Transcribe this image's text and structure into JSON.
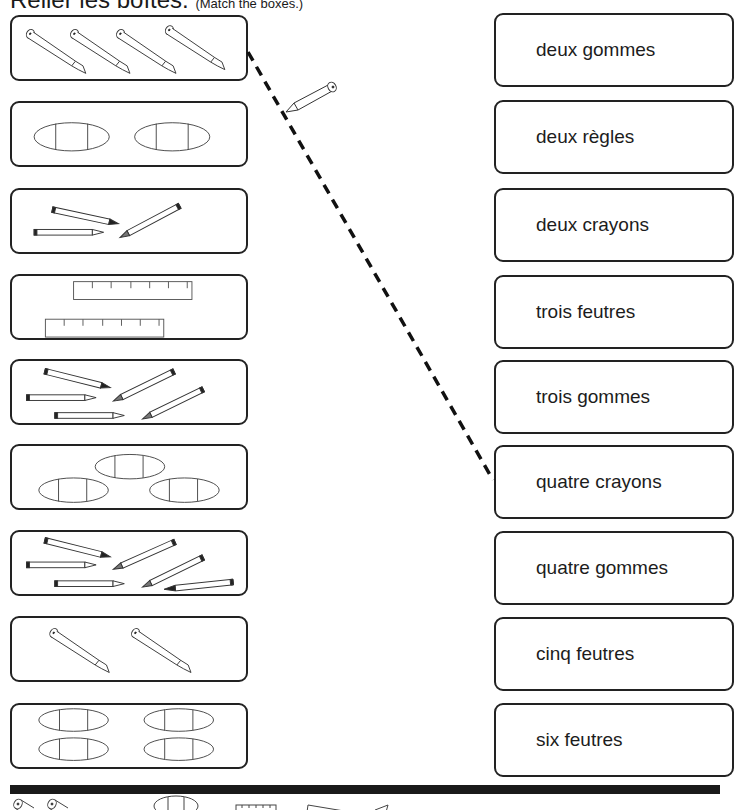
{
  "title": {
    "main": "Relier les boîtes.",
    "sub": "(Match the boxes.)"
  },
  "left_boxes": [
    {
      "icon": "pencil-icon",
      "count": 4,
      "label": "four pencils"
    },
    {
      "icon": "eraser-icon",
      "count": 2,
      "label": "two erasers"
    },
    {
      "icon": "felt-pen-icon",
      "count": 3,
      "label": "three felt pens"
    },
    {
      "icon": "ruler-icon",
      "count": 2,
      "label": "two rulers"
    },
    {
      "icon": "felt-pen-icon",
      "count": 5,
      "label": "five felt pens"
    },
    {
      "icon": "eraser-icon",
      "count": 3,
      "label": "three erasers"
    },
    {
      "icon": "felt-pen-icon",
      "count": 6,
      "label": "six felt pens"
    },
    {
      "icon": "pencil-icon",
      "count": 2,
      "label": "two pencils"
    },
    {
      "icon": "eraser-icon",
      "count": 4,
      "label": "four erasers"
    }
  ],
  "right_boxes": [
    {
      "label": "deux gommes"
    },
    {
      "label": "deux règles"
    },
    {
      "label": "deux crayons"
    },
    {
      "label": "trois feutres"
    },
    {
      "label": "trois gommes"
    },
    {
      "label": "quatre crayons"
    },
    {
      "label": "quatre gommes"
    },
    {
      "label": "cinq feutres"
    },
    {
      "label": "six feutres"
    }
  ],
  "example_line": {
    "from_left_index": 0,
    "to_right_index": 5,
    "style": "dashed",
    "color": "#111111"
  },
  "colors": {
    "ink": "#1a1a1a",
    "box_border": "#222222",
    "background": "#ffffff"
  }
}
